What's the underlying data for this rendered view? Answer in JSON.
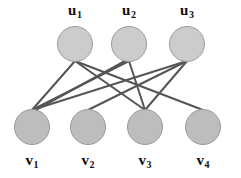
{
  "figure": {
    "type": "bipartite-graph",
    "width": 241,
    "height": 178,
    "background_color": "#ffffff"
  },
  "style": {
    "top_node_fill": "#cccccc",
    "bottom_node_fill": "#bdbdbd",
    "node_stroke": "#9a9a9a",
    "node_stroke_width": 1,
    "node_radius": 17.5,
    "edge_color": "#555555",
    "edge_width": 2,
    "label_color": "#111111"
  },
  "top_nodes": [
    {
      "id": "u1",
      "base": "u",
      "sub": "1",
      "label": "u1",
      "cx": 75,
      "cy": 44,
      "label_x": 75,
      "label_y": 2
    },
    {
      "id": "u2",
      "base": "u",
      "sub": "2",
      "label": "u2",
      "cx": 129,
      "cy": 44,
      "label_x": 129,
      "label_y": 2
    },
    {
      "id": "u3",
      "base": "u",
      "sub": "3",
      "label": "u3",
      "cx": 187,
      "cy": 44,
      "label_x": 187,
      "label_y": 2
    }
  ],
  "bottom_nodes": [
    {
      "id": "v1",
      "base": "v",
      "sub": "1",
      "label": "v1",
      "cx": 32,
      "cy": 127,
      "label_x": 32,
      "label_y": 152
    },
    {
      "id": "v2",
      "base": "v",
      "sub": "2",
      "label": "v2",
      "cx": 88,
      "cy": 127,
      "label_x": 88,
      "label_y": 152
    },
    {
      "id": "v3",
      "base": "v",
      "sub": "3",
      "label": "v3",
      "cx": 145,
      "cy": 127,
      "label_x": 145,
      "label_y": 152
    },
    {
      "id": "v4",
      "base": "v",
      "sub": "4",
      "label": "v4",
      "cx": 203,
      "cy": 127,
      "label_x": 203,
      "label_y": 152
    }
  ],
  "edges": [
    {
      "from": "u1",
      "to": "v1",
      "x1": 75,
      "y1": 61,
      "x2": 32,
      "y2": 110
    },
    {
      "from": "u1",
      "to": "v3",
      "x1": 75,
      "y1": 61,
      "x2": 145,
      "y2": 110
    },
    {
      "from": "u1",
      "to": "v4",
      "x1": 75,
      "y1": 61,
      "x2": 203,
      "y2": 110
    },
    {
      "from": "u2",
      "to": "v1",
      "x1": 129,
      "y1": 61,
      "x2": 32,
      "y2": 110
    },
    {
      "from": "u2",
      "to": "v3",
      "x1": 129,
      "y1": 61,
      "x2": 145,
      "y2": 110
    },
    {
      "from": "u2",
      "to": "v1",
      "x1": 125,
      "y1": 61,
      "x2": 32,
      "y2": 112
    },
    {
      "from": "u3",
      "to": "v1",
      "x1": 187,
      "y1": 61,
      "x2": 32,
      "y2": 110
    },
    {
      "from": "u3",
      "to": "v2",
      "x1": 187,
      "y1": 61,
      "x2": 88,
      "y2": 110
    },
    {
      "from": "u3",
      "to": "v3",
      "x1": 187,
      "y1": 61,
      "x2": 145,
      "y2": 110
    }
  ]
}
